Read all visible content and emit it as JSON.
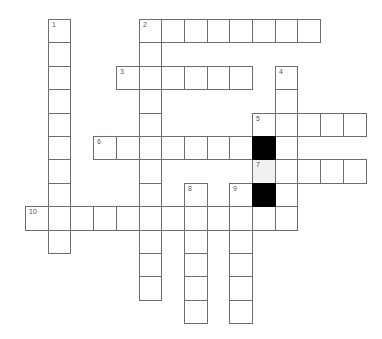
{
  "puzzle": {
    "type": "crossword",
    "grid_origin": {
      "x": 25,
      "y": 19
    },
    "cell_size": {
      "w": 22.7,
      "h": 23.4
    },
    "colors": {
      "border": "#6e6e6e",
      "block": "#000000",
      "shaded": "#f0f0f0",
      "number": "#555555"
    },
    "clues": [
      {
        "number": "1",
        "direction": "down",
        "row": 0,
        "col": 1,
        "length": 10
      },
      {
        "number": "2",
        "direction": "across",
        "row": 0,
        "col": 5,
        "length": 8
      },
      {
        "number": "2",
        "direction": "down",
        "row": 0,
        "col": 5,
        "length": 12
      },
      {
        "number": "3",
        "direction": "across",
        "row": 2,
        "col": 4,
        "length": 6
      },
      {
        "number": "4",
        "direction": "down",
        "row": 2,
        "col": 11,
        "length": 7
      },
      {
        "number": "5",
        "direction": "across",
        "row": 4,
        "col": 10,
        "length": 5
      },
      {
        "number": "6",
        "direction": "across",
        "row": 5,
        "col": 3,
        "length": 7
      },
      {
        "number": "7",
        "direction": "across",
        "row": 6,
        "col": 10,
        "length": 5
      },
      {
        "number": "8",
        "direction": "down",
        "row": 7,
        "col": 7,
        "length": 6
      },
      {
        "number": "9",
        "direction": "down",
        "row": 7,
        "col": 9,
        "length": 6
      },
      {
        "number": "10",
        "direction": "across",
        "row": 8,
        "col": 0,
        "length": 12
      }
    ],
    "blocks": [
      {
        "row": 5,
        "col": 10
      },
      {
        "row": 7,
        "col": 10
      }
    ],
    "shaded": [
      {
        "row": 6,
        "col": 10
      }
    ]
  }
}
